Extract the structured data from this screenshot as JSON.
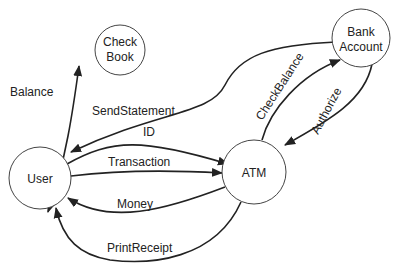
{
  "diagram": {
    "type": "data-flow",
    "nodes": [
      {
        "id": "checkbook",
        "lines": [
          "Check",
          "Book"
        ]
      },
      {
        "id": "bank",
        "lines": [
          "Bank",
          "Account"
        ]
      },
      {
        "id": "user",
        "lines": [
          "User"
        ]
      },
      {
        "id": "atm",
        "lines": [
          "ATM"
        ]
      }
    ],
    "edges": [
      {
        "id": "balance",
        "label": "Balance",
        "from": "user",
        "to": "checkbook",
        "bidirectional": true
      },
      {
        "id": "sendstatement",
        "label": "SendStatement",
        "from": "bank",
        "to": "user"
      },
      {
        "id": "id",
        "label": "ID",
        "from": "user",
        "to": "atm"
      },
      {
        "id": "transaction",
        "label": "Transaction",
        "from": "user",
        "to": "atm"
      },
      {
        "id": "money",
        "label": "Money",
        "from": "atm",
        "to": "user"
      },
      {
        "id": "printreceipt",
        "label": "PrintReceipt",
        "from": "atm",
        "to": "user"
      },
      {
        "id": "checkbalance",
        "label": "CheckBalance",
        "from": "atm",
        "to": "bank"
      },
      {
        "id": "authorize",
        "label": "Authorize",
        "from": "bank",
        "to": "atm"
      }
    ]
  }
}
